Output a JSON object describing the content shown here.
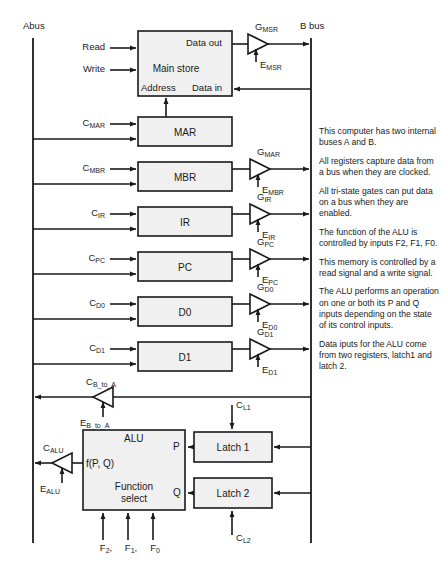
{
  "diagram": {
    "buses": {
      "a_bus_label": "Abus",
      "b_bus_label": "B bus"
    },
    "memory": {
      "name": "Main store",
      "port_data_out": "Data out",
      "port_data_in": "Data in",
      "port_address": "Address",
      "ctrl_read": "Read",
      "ctrl_write": "Write",
      "gate_enable_top": "G",
      "gate_enable_top_sub": "MSR",
      "gate_enable_bottom": "E",
      "gate_enable_bottom_sub": "MSR"
    },
    "registers": [
      {
        "name": "MAR",
        "clock": "C",
        "clock_sub": "MAR",
        "has_gate": false,
        "gate_top": "",
        "gate_top_sub": "",
        "gate_bottom": "",
        "gate_bottom_sub": ""
      },
      {
        "name": "MBR",
        "clock": "C",
        "clock_sub": "MBR",
        "has_gate": true,
        "gate_top": "G",
        "gate_top_sub": "MAR",
        "gate_bottom": "E",
        "gate_bottom_sub": "MBR"
      },
      {
        "name": "IR",
        "clock": "C",
        "clock_sub": "IR",
        "has_gate": true,
        "gate_top": "G",
        "gate_top_sub": "IR",
        "gate_bottom": "E",
        "gate_bottom_sub": "IR"
      },
      {
        "name": "PC",
        "clock": "C",
        "clock_sub": "PC",
        "has_gate": true,
        "gate_top": "G",
        "gate_top_sub": "PC",
        "gate_bottom": "E",
        "gate_bottom_sub": "PC"
      },
      {
        "name": "D0",
        "clock": "C",
        "clock_sub": "D0",
        "has_gate": true,
        "gate_top": "G",
        "gate_top_sub": "D0",
        "gate_bottom": "E",
        "gate_bottom_sub": "D0"
      },
      {
        "name": "D1",
        "clock": "C",
        "clock_sub": "D1",
        "has_gate": true,
        "gate_top": "G",
        "gate_top_sub": "D1",
        "gate_bottom": "E",
        "gate_bottom_sub": "D1"
      }
    ],
    "b_to_a_gate": {
      "ctrl_top": "C",
      "ctrl_top_sub": "B_to_A",
      "ctrl_bottom": "E",
      "ctrl_bottom_sub": "B_to_A"
    },
    "alu": {
      "name": "ALU",
      "function_label_line1": "Function",
      "function_label_line2": "select",
      "output_expr": "f(P, Q)",
      "input_p": "P",
      "input_q": "Q",
      "gate_top": "C",
      "gate_top_sub": "ALU",
      "gate_bottom": "E",
      "gate_bottom_sub": "ALU",
      "function_inputs": [
        {
          "label": "F",
          "sub": "2",
          "trail": ","
        },
        {
          "label": "F",
          "sub": "1",
          "trail": ","
        },
        {
          "label": "F",
          "sub": "0",
          "trail": ""
        }
      ]
    },
    "latches": [
      {
        "name": "Latch 1",
        "clock": "C",
        "clock_sub": "L1"
      },
      {
        "name": "Latch 2",
        "clock": "C",
        "clock_sub": "L2"
      }
    ],
    "notes": [
      "This computer has two internal buses A and B.",
      "All registers capture data from a bus when they are clocked.",
      "All tri-state gates can put data on a bus when they are enabled.",
      "The function of the ALU is controlled by inputs F2, F1, F0.",
      "This memory is controlled by a read signal and a write signal.",
      "The ALU performs an operation on one or both its P and Q inputs depending on the state of its control inputs.",
      "Data iputs for the ALU come from two registers, latch1 and latch 2."
    ]
  }
}
